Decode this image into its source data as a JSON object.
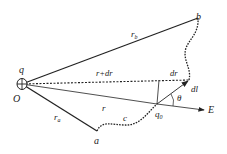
{
  "diagram": {
    "colors": {
      "line": "#222222",
      "background": "#ffffff"
    },
    "points": {
      "O": {
        "label": "O",
        "x": 22,
        "y": 84
      },
      "a": {
        "label": "a",
        "x": 97,
        "y": 131
      },
      "b": {
        "label": "b",
        "x": 198,
        "y": 18
      },
      "q0": {
        "label": "q",
        "sub": "0",
        "x": 157,
        "y": 104
      },
      "dl_tip": {
        "x": 189,
        "y": 81
      }
    },
    "labels": {
      "charge": "q",
      "origin": "O",
      "rb": "r",
      "rb_sub": "b",
      "ra": "r",
      "ra_sub": "a",
      "r_plus_dr": "r+dr",
      "r": "r",
      "dr": "dr",
      "dl": "dl",
      "theta": "θ",
      "E": "E",
      "c": "c",
      "a": "a",
      "b": "b",
      "q0": "q",
      "q0_sub": "0"
    }
  }
}
